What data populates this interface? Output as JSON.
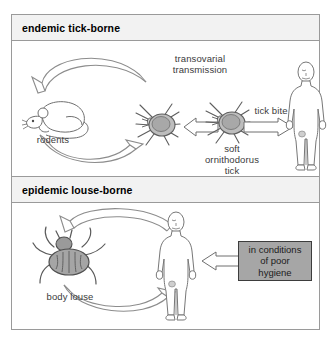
{
  "figure": {
    "border_color": "#9a9a9a",
    "background": "#ffffff"
  },
  "panels": [
    {
      "id": "endemic-tick-borne",
      "header": "endemic tick-borne",
      "header_bg": "#f2f2f2",
      "labels": {
        "rodents": "rodents",
        "transovarial": "transovarial\ntransmission",
        "tick_name": "soft\nornithodorus\ntick",
        "tick_bite": "tick bite"
      },
      "figures": [
        {
          "name": "rodent",
          "label": "rodents"
        },
        {
          "name": "tick-left",
          "label": "soft ornithodorus tick"
        },
        {
          "name": "tick-right",
          "label": "soft ornithodorus tick"
        },
        {
          "name": "human",
          "label": "human"
        }
      ],
      "arrows": [
        {
          "name": "rodent-to-tick-arc",
          "label": "transovarial transmission"
        },
        {
          "name": "tick-to-rodent-arc",
          "label": ""
        },
        {
          "name": "tick-right-to-tick-left",
          "label": ""
        },
        {
          "name": "tick-to-human",
          "label": "tick bite"
        }
      ]
    },
    {
      "id": "epidemic-louse-borne",
      "header": "epidemic louse-borne",
      "header_bg": "#f2f2f2",
      "labels": {
        "body_louse": "body louse",
        "hygiene_box": "in conditions\nof poor hygiene"
      },
      "figures": [
        {
          "name": "body-louse",
          "label": "body louse"
        },
        {
          "name": "human",
          "label": "human"
        }
      ],
      "arrows": [
        {
          "name": "human-to-louse-arc",
          "label": ""
        },
        {
          "name": "louse-to-human-arc",
          "label": ""
        },
        {
          "name": "hygiene-to-human",
          "label": "in conditions of poor hygiene"
        }
      ],
      "callout": {
        "text": "in conditions\nof poor hygiene",
        "fill": "#a6a6a6",
        "border": "#3d3d3d"
      }
    }
  ],
  "colors": {
    "ink": "#3b3b3b",
    "line": "#808080",
    "tick_body": "#b4b4b4",
    "louse_body": "#9e9e9e",
    "callout_fill": "#a6a6a6"
  }
}
